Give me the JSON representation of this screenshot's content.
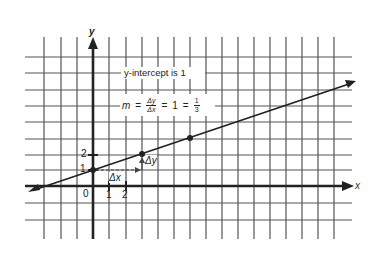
{
  "diagram": {
    "axes": {
      "x_label": "x",
      "y_label": "y",
      "origin_label": "0",
      "x_ticks": [
        "1",
        "2"
      ],
      "y_ticks": [
        "1",
        "2"
      ]
    },
    "annotations": {
      "intercept_text": "y-intercept is 1",
      "slope_m": "m",
      "equals": "=",
      "delta_y": "Δy",
      "delta_x": "Δx",
      "one": "1",
      "frac_num": "1",
      "frac_den": "3",
      "dx_label": "Δx",
      "dy_label": "Δy"
    },
    "line": {
      "slope": "1/3",
      "intercept": 1,
      "points": [
        [
          0,
          1
        ],
        [
          3,
          2
        ],
        [
          6,
          3
        ]
      ]
    },
    "colors": {
      "grid": "#555555",
      "axis": "#222222",
      "background": "#ffffff"
    }
  }
}
